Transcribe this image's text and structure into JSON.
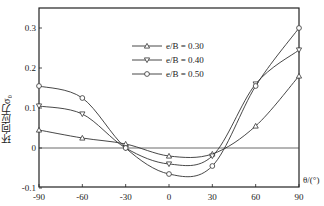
{
  "chart_data": {
    "type": "line",
    "title": "",
    "xlabel": "θ/(°)",
    "ylabel": "环向应力σ₀",
    "xlim": [
      -90,
      90
    ],
    "ylim": [
      -0.1,
      0.33
    ],
    "x_ticks": [
      -90,
      -60,
      -30,
      0,
      30,
      60,
      90
    ],
    "y_ticks": [
      -0.1,
      0,
      0.1,
      0.2,
      0.3
    ],
    "grid": false,
    "legend_position": "upper-center",
    "x": [
      -90,
      -60,
      -30,
      0,
      30,
      60,
      90
    ],
    "series": [
      {
        "name": "e/B = 0.30",
        "marker": "triangle-up",
        "values": [
          0.045,
          0.025,
          0.01,
          -0.02,
          -0.015,
          0.055,
          0.18
        ]
      },
      {
        "name": "e/B = 0.40",
        "marker": "triangle-down",
        "values": [
          0.105,
          0.085,
          0.0,
          -0.04,
          -0.02,
          0.16,
          0.245
        ]
      },
      {
        "name": "e/B = 0.50",
        "marker": "circle",
        "values": [
          0.155,
          0.125,
          0.0,
          -0.065,
          -0.045,
          0.155,
          0.3
        ]
      }
    ]
  },
  "axis": {
    "xlabel": "θ/(°)",
    "ylabel": "环向应力σ₀"
  },
  "legend": [
    {
      "label": "e/B = 0.30"
    },
    {
      "label": "e/B = 0.40"
    },
    {
      "label": "e/B = 0.50"
    }
  ]
}
